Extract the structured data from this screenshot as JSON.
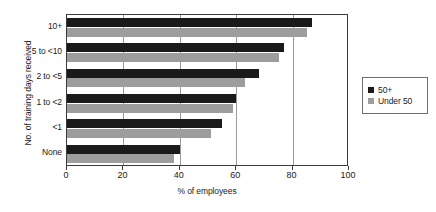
{
  "chart_data": {
    "type": "bar",
    "orientation": "horizontal",
    "title": "",
    "xlabel": "% of employees",
    "ylabel": "No. of training days received",
    "categories": [
      "10+",
      "5 to <10",
      "2 to <5",
      "1 to <2",
      "<1",
      "None"
    ],
    "xlim": [
      0,
      100
    ],
    "xticks": [
      0,
      20,
      40,
      60,
      80,
      100
    ],
    "grid": true,
    "grid_axis": "x",
    "legend_position": "right",
    "series": [
      {
        "name": "50+",
        "color": "#1a1a1a",
        "values": [
          87,
          77,
          68,
          60,
          55,
          40
        ]
      },
      {
        "name": "Under 50",
        "color": "#9d9d9d",
        "values": [
          85,
          75,
          63,
          59,
          51,
          38
        ]
      }
    ]
  },
  "legend": {
    "items": [
      {
        "label": "50+",
        "color": "#1a1a1a"
      },
      {
        "label": "Under 50",
        "color": "#9d9d9d"
      }
    ]
  }
}
